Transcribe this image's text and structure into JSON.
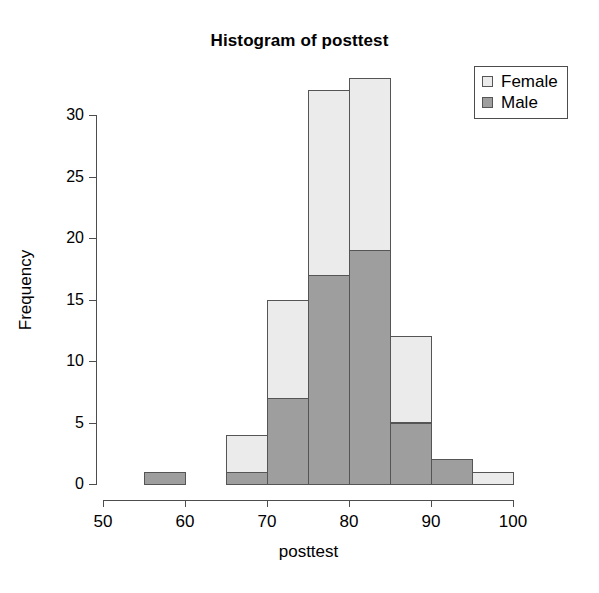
{
  "chart_data": {
    "type": "bar",
    "title": "Histogram of posttest",
    "xlabel": "posttest",
    "ylabel": "Frequency",
    "xlim": [
      50,
      100
    ],
    "ylim": [
      0,
      33
    ],
    "x_ticks": [
      50,
      60,
      70,
      80,
      90,
      100
    ],
    "y_ticks": [
      0,
      5,
      10,
      15,
      20,
      25,
      30
    ],
    "grid": false,
    "stacked": true,
    "bin_width": 5,
    "bins": [
      {
        "start": 50,
        "end": 55
      },
      {
        "start": 55,
        "end": 60
      },
      {
        "start": 60,
        "end": 65
      },
      {
        "start": 65,
        "end": 70
      },
      {
        "start": 70,
        "end": 75
      },
      {
        "start": 75,
        "end": 80
      },
      {
        "start": 80,
        "end": 85
      },
      {
        "start": 85,
        "end": 90
      },
      {
        "start": 90,
        "end": 95
      },
      {
        "start": 95,
        "end": 100
      }
    ],
    "categories": [
      "50-55",
      "55-60",
      "60-65",
      "65-70",
      "70-75",
      "75-80",
      "80-85",
      "85-90",
      "90-95",
      "95-100"
    ],
    "series": [
      {
        "name": "Male",
        "color": "#9e9e9e",
        "values": [
          0,
          1,
          0,
          1,
          7,
          17,
          19,
          5,
          2,
          0
        ]
      },
      {
        "name": "Female",
        "color": "#ebebeb",
        "values": [
          0,
          0,
          0,
          3,
          8,
          15,
          14,
          7,
          0,
          1
        ]
      }
    ],
    "totals": [
      0,
      1,
      0,
      4,
      15,
      32,
      33,
      12,
      2,
      1
    ],
    "legend": {
      "position": "top-right",
      "entries": [
        {
          "label": "Female",
          "color": "#ebebeb"
        },
        {
          "label": "Male",
          "color": "#9e9e9e"
        }
      ]
    },
    "colors": {
      "female": "#ebebeb",
      "male": "#9e9e9e",
      "border": "#555555",
      "axis": "#4d4d4d",
      "background": "#ffffff"
    }
  },
  "labels": {
    "y_tick_0": "0",
    "y_tick_5": "5",
    "y_tick_10": "10",
    "y_tick_15": "15",
    "y_tick_20": "20",
    "y_tick_25": "25",
    "y_tick_30": "30",
    "x_tick_50": "50",
    "x_tick_60": "60",
    "x_tick_70": "70",
    "x_tick_80": "80",
    "x_tick_90": "90",
    "x_tick_100": "100"
  }
}
